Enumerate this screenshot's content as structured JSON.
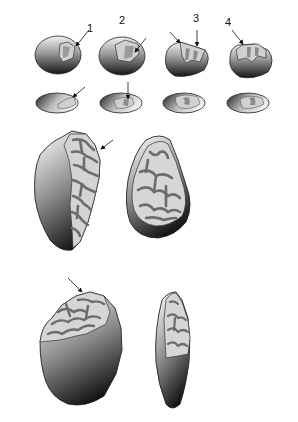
{
  "figure": {
    "stage_labels": [
      "1",
      "2",
      "3",
      "4"
    ],
    "label_positions": [
      {
        "x": 89,
        "y": 26
      },
      {
        "x": 120,
        "y": 18
      },
      {
        "x": 195,
        "y": 16
      },
      {
        "x": 226,
        "y": 20
      }
    ],
    "colors": {
      "stone_light": "#e8e8e8",
      "stone_dark": "#1a1a1a",
      "scar_light": "#d6d6d6",
      "scar_mid": "#7a7a7a",
      "outline": "#222222"
    }
  }
}
